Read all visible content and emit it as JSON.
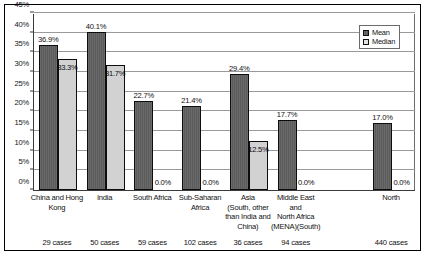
{
  "chart_data": {
    "type": "bar",
    "title": "",
    "xlabel": "",
    "ylabel": "",
    "ylim": [
      0,
      45
    ],
    "ytick_labels": [
      "0%",
      "5%",
      "10%",
      "15%",
      "20%",
      "25%",
      "30%",
      "35%",
      "40%",
      "45%"
    ],
    "ytick_values": [
      0,
      5,
      10,
      15,
      20,
      25,
      30,
      35,
      40,
      45
    ],
    "grid": true,
    "legend_position": "top-right",
    "categories": [
      "China and Hong Kong",
      "India",
      "South Africa",
      "Sub-Saharan Africa",
      "Asia (South, other than India and China)",
      "Middle East and North Africa (MENA)(South)",
      "North"
    ],
    "category_lines": [
      [
        "China and Hong",
        "Kong"
      ],
      [
        "India"
      ],
      [
        "South Africa"
      ],
      [
        "Sub-Saharan",
        "Africa"
      ],
      [
        "Asia",
        "(South, other",
        "than India and",
        "China)"
      ],
      [
        "Middle East",
        "and",
        "North Africa",
        "(MENA)(South)"
      ],
      [
        "North"
      ]
    ],
    "series": [
      {
        "name": "Mean",
        "color": "#5a5a5a",
        "values": [
          36.9,
          40.1,
          22.7,
          21.4,
          29.4,
          17.7,
          17.0
        ],
        "labels": [
          "36.9%",
          "40.1%",
          "22.7%",
          "21.4%",
          "29.4%",
          "17.7%",
          "17.0%"
        ]
      },
      {
        "name": "Median",
        "color": "#d2d2d2",
        "values": [
          33.3,
          31.7,
          0.0,
          0.0,
          12.5,
          0.0,
          0.0
        ],
        "labels": [
          "33.3%",
          "31.7%",
          "0.0%",
          "0.0%",
          "12.5%",
          "0.0%",
          "0.0%"
        ]
      }
    ],
    "case_counts": [
      "29 cases",
      "50 cases",
      "59 cases",
      "102 cases",
      "36 cases",
      "94 cases",
      "440 cases"
    ]
  },
  "legend": {
    "entries": [
      {
        "label": "Mean"
      },
      {
        "label": "Median"
      }
    ]
  }
}
